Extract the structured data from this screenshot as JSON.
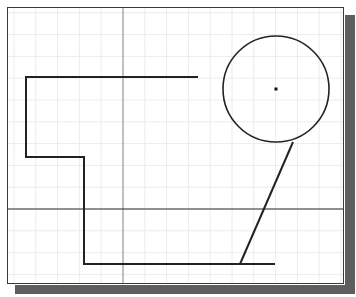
{
  "drawing_area": {
    "background": "#ffffff",
    "frame_color": "#3a3a3a",
    "shadow_color": "#5e5e5e",
    "grid": {
      "spacing_px": 21.8,
      "color": "#ececec",
      "origin_x": 123,
      "origin_y": 209
    },
    "crosshair": {
      "x": 123,
      "y": 209,
      "vertical_color": "#8a8a8a",
      "horizontal_color": "#2a2a2a"
    }
  },
  "entities": {
    "polyline": {
      "points": "198,77 26,77 26,157 84,157 84,264 275,264",
      "color": "#222222",
      "stroke_width": 2
    },
    "circle": {
      "cx": 276,
      "cy": 89,
      "r": 53,
      "color": "#222222",
      "stroke_width": 1.6
    },
    "center_point": {
      "cx": 276,
      "cy": 89
    },
    "tangent_line": {
      "x1": 293,
      "y1": 142,
      "x2": 240,
      "y2": 264,
      "color": "#222222",
      "stroke_width": 2
    }
  }
}
